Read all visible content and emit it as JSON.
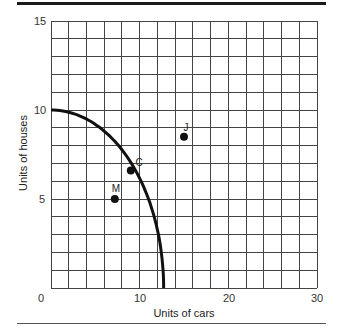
{
  "chart_data": {
    "type": "line",
    "title": "",
    "xlabel": "Units of cars",
    "ylabel": "Units of houses",
    "xlim": [
      0,
      30
    ],
    "ylim": [
      0,
      15
    ],
    "grid": true,
    "x_ticks": [
      "0",
      "10",
      "20",
      "30"
    ],
    "y_ticks": [
      "5",
      "10",
      "15"
    ],
    "series": [
      {
        "name": "Production possibilities frontier",
        "x": [
          0,
          2,
          4,
          6,
          8,
          9,
          10,
          11,
          12,
          12.7
        ],
        "y": [
          10,
          9.9,
          9.6,
          8.9,
          7.7,
          6.8,
          6.0,
          4.8,
          3.0,
          0
        ]
      }
    ],
    "points": [
      {
        "label": "J",
        "x": 15,
        "y": 8.5
      },
      {
        "label": "C",
        "x": 9,
        "y": 6.6
      },
      {
        "label": "M",
        "x": 7.2,
        "y": 5
      }
    ]
  },
  "labels": {
    "xlabel": "Units of cars",
    "ylabel": "Units of houses",
    "x0": "0",
    "x10": "10",
    "x20": "20",
    "x30": "30",
    "y5": "5",
    "y10": "10",
    "y15": "15",
    "pJ": "J",
    "pC": "C",
    "pM": "M"
  }
}
